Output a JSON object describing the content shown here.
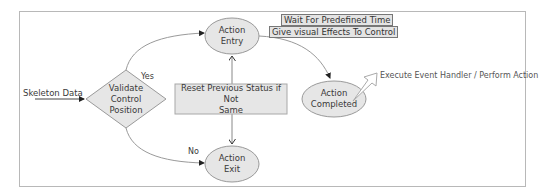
{
  "diagram": {
    "input_label": "Skeleton Data",
    "decision": {
      "line1": "Validate",
      "line2": "Control",
      "line3": "Position"
    },
    "yes_label": "Yes",
    "no_label": "No",
    "action_entry": {
      "line1": "Action",
      "line2": "Entry"
    },
    "action_exit": {
      "line1": "Action",
      "line2": "Exit"
    },
    "action_completed": {
      "line1": "Action",
      "line2": "Completed"
    },
    "reset_box": {
      "line1": "Reset Previous Status if Not",
      "line2": "Same"
    },
    "notes": {
      "wait": "Wait For Predefined Time",
      "effects": "Give visual Effects To Control"
    },
    "callout": "Execute Event Handler / Perform Action",
    "colors": {
      "shape_fill": "#e6e6e6",
      "shape_stroke": "#9a9a9a",
      "line": "#8a8a8a",
      "arrowhead": "#222222",
      "frame": "#b8b8b8"
    }
  }
}
